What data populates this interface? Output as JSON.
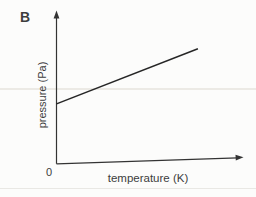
{
  "figure": {
    "panel_label": "B",
    "origin_label": "0"
  },
  "chart_data": {
    "type": "line",
    "title": "",
    "xlabel": "temperature (K)",
    "ylabel": "pressure (Pa)",
    "xlim": [
      0,
      1
    ],
    "ylim": [
      0,
      1
    ],
    "grid": false,
    "axis_tick_labels_visible": [
      "0"
    ],
    "legend": "none",
    "series": [
      {
        "name": "pressure-vs-temperature-line",
        "x": [
          0,
          0.76
        ],
        "y": [
          0.4,
          0.77
        ]
      }
    ]
  },
  "colors": {
    "background": "#fcfcfb",
    "ink": "#333333",
    "text": "#3d3d3d"
  }
}
